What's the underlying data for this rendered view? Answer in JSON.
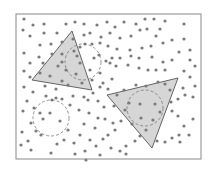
{
  "diagram": {
    "width": 215,
    "height": 172,
    "colors": {
      "background": "#ffffff",
      "frame": "#888888",
      "dot": "#7a7a7a",
      "triangle_fill": "#d6d6d6",
      "triangle_stroke": "#555555",
      "circle_stroke": "#777777"
    },
    "frame": {
      "x": 16,
      "y": 14,
      "width": 185,
      "height": 145
    },
    "dot_radius": 1.6,
    "triangles": [
      {
        "points": [
          [
            72,
            31
          ],
          [
            32,
            80
          ],
          [
            92,
            90
          ]
        ]
      },
      {
        "points": [
          [
            107,
            95
          ],
          [
            178,
            78
          ],
          [
            152,
            148
          ]
        ]
      }
    ],
    "dashed_circles": [
      {
        "cx": 83,
        "cy": 62,
        "r": 18
      },
      {
        "cx": 145,
        "cy": 108,
        "r": 18
      },
      {
        "cx": 51,
        "cy": 118,
        "r": 18
      }
    ],
    "dots": [
      [
        24,
        19
      ],
      [
        33,
        25
      ],
      [
        44,
        24
      ],
      [
        23,
        30
      ],
      [
        30,
        36
      ],
      [
        44,
        33
      ],
      [
        57,
        33
      ],
      [
        66,
        24
      ],
      [
        75,
        22
      ],
      [
        84,
        24
      ],
      [
        97,
        25
      ],
      [
        107,
        22
      ],
      [
        115,
        27
      ],
      [
        110,
        33
      ],
      [
        124,
        22
      ],
      [
        136,
        24
      ],
      [
        145,
        19
      ],
      [
        154,
        19
      ],
      [
        160,
        29
      ],
      [
        165,
        21
      ],
      [
        184,
        24
      ],
      [
        140,
        30
      ],
      [
        147,
        29
      ],
      [
        156,
        36
      ],
      [
        131,
        36
      ],
      [
        120,
        38
      ],
      [
        101,
        37
      ],
      [
        90,
        33
      ],
      [
        84,
        35
      ],
      [
        73,
        39
      ],
      [
        40,
        45
      ],
      [
        51,
        44
      ],
      [
        62,
        42
      ],
      [
        85,
        44
      ],
      [
        92,
        44
      ],
      [
        100,
        43
      ],
      [
        108,
        46
      ],
      [
        117,
        49
      ],
      [
        130,
        50
      ],
      [
        142,
        48
      ],
      [
        151,
        46
      ],
      [
        163,
        43
      ],
      [
        172,
        40
      ],
      [
        184,
        39
      ],
      [
        190,
        50
      ],
      [
        24,
        53
      ],
      [
        39,
        57
      ],
      [
        30,
        63
      ],
      [
        24,
        71
      ],
      [
        30,
        77
      ],
      [
        43,
        63
      ],
      [
        62,
        54
      ],
      [
        74,
        51
      ],
      [
        80,
        47
      ],
      [
        99,
        55
      ],
      [
        106,
        61
      ],
      [
        112,
        58
      ],
      [
        120,
        58
      ],
      [
        131,
        56
      ],
      [
        139,
        58
      ],
      [
        152,
        57
      ],
      [
        163,
        62
      ],
      [
        172,
        60
      ],
      [
        179,
        52
      ],
      [
        190,
        60
      ],
      [
        195,
        66
      ],
      [
        110,
        63
      ],
      [
        116,
        66
      ],
      [
        128,
        65
      ],
      [
        139,
        68
      ],
      [
        148,
        70
      ],
      [
        156,
        70
      ],
      [
        165,
        70
      ],
      [
        184,
        71
      ],
      [
        190,
        77
      ],
      [
        195,
        86
      ],
      [
        112,
        79
      ],
      [
        100,
        87
      ],
      [
        93,
        93
      ],
      [
        84,
        97
      ],
      [
        73,
        96
      ],
      [
        62,
        99
      ],
      [
        46,
        96
      ],
      [
        33,
        92
      ],
      [
        24,
        87
      ],
      [
        27,
        101
      ],
      [
        23,
        111
      ],
      [
        34,
        108
      ],
      [
        40,
        113
      ],
      [
        43,
        119
      ],
      [
        31,
        123
      ],
      [
        36,
        131
      ],
      [
        41,
        135
      ],
      [
        21,
        145
      ],
      [
        31,
        150
      ],
      [
        51,
        153
      ],
      [
        64,
        140
      ],
      [
        74,
        143
      ],
      [
        80,
        135
      ],
      [
        68,
        130
      ],
      [
        60,
        121
      ],
      [
        50,
        113
      ],
      [
        52,
        100
      ],
      [
        56,
        98
      ],
      [
        70,
        105
      ],
      [
        79,
        110
      ],
      [
        89,
        113
      ],
      [
        98,
        118
      ],
      [
        105,
        119
      ],
      [
        113,
        123
      ],
      [
        121,
        121
      ],
      [
        115,
        130
      ],
      [
        108,
        135
      ],
      [
        103,
        139
      ],
      [
        90,
        140
      ],
      [
        96,
        146
      ],
      [
        85,
        151
      ],
      [
        75,
        154
      ],
      [
        100,
        155
      ],
      [
        111,
        148
      ],
      [
        120,
        151
      ],
      [
        126,
        154
      ],
      [
        126,
        146
      ],
      [
        135,
        141
      ],
      [
        140,
        136
      ],
      [
        146,
        130
      ],
      [
        157,
        141
      ],
      [
        165,
        142
      ],
      [
        172,
        138
      ],
      [
        179,
        135
      ],
      [
        180,
        142
      ],
      [
        189,
        135
      ],
      [
        193,
        119
      ],
      [
        184,
        126
      ],
      [
        178,
        116
      ],
      [
        172,
        111
      ],
      [
        171,
        102
      ],
      [
        178,
        99
      ],
      [
        185,
        95
      ],
      [
        193,
        97
      ],
      [
        183,
        88
      ],
      [
        170,
        90
      ],
      [
        165,
        84
      ],
      [
        158,
        82
      ],
      [
        146,
        86
      ],
      [
        136,
        85
      ],
      [
        124,
        90
      ],
      [
        117,
        95
      ],
      [
        129,
        103
      ],
      [
        140,
        104
      ],
      [
        155,
        104
      ],
      [
        141,
        118
      ],
      [
        153,
        120
      ],
      [
        132,
        124
      ],
      [
        160,
        112
      ],
      [
        125,
        110
      ],
      [
        88,
        100
      ],
      [
        98,
        101
      ],
      [
        82,
        83
      ],
      [
        76,
        74
      ],
      [
        66,
        70
      ],
      [
        58,
        66
      ],
      [
        50,
        76
      ],
      [
        62,
        81
      ],
      [
        80,
        63
      ],
      [
        77,
        56
      ],
      [
        90,
        70
      ],
      [
        94,
        58
      ],
      [
        100,
        73
      ],
      [
        92,
        80
      ],
      [
        103,
        83
      ],
      [
        108,
        89
      ],
      [
        68,
        85
      ],
      [
        56,
        89
      ],
      [
        45,
        86
      ],
      [
        40,
        73
      ],
      [
        52,
        54
      ],
      [
        62,
        62
      ],
      [
        22,
        132
      ],
      [
        28,
        141
      ],
      [
        57,
        144
      ],
      [
        84,
        124
      ],
      [
        95,
        128
      ],
      [
        104,
        107
      ],
      [
        114,
        106
      ],
      [
        86,
        160
      ]
    ]
  }
}
